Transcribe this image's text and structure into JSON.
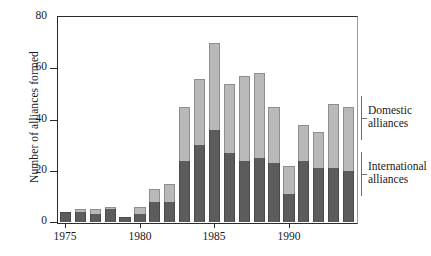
{
  "chart_data": {
    "type": "bar",
    "subtype": "stacked-vertical",
    "title": "",
    "xlabel": "",
    "ylabel": "Number of alliances formed",
    "ylim": [
      0,
      80
    ],
    "yticks": [
      0,
      20,
      40,
      60,
      80
    ],
    "xticks": [
      1975,
      1980,
      1985,
      1990
    ],
    "xtick_labels": [
      "1975",
      "1980",
      "1985",
      "1990"
    ],
    "grid": false,
    "legend_position": "right",
    "categories": [
      1975,
      1976,
      1977,
      1978,
      1979,
      1980,
      1981,
      1982,
      1983,
      1984,
      1985,
      1986,
      1987,
      1988,
      1989,
      1990,
      1991,
      1992,
      1993,
      1994
    ],
    "series": [
      {
        "name": "International alliances",
        "color": "#5c5c5c",
        "values": [
          4,
          4,
          3,
          5,
          2,
          3,
          8,
          8,
          24,
          30,
          36,
          27,
          24,
          25,
          23,
          11,
          24,
          21,
          21,
          20
        ]
      },
      {
        "name": "Domestic alliances",
        "color": "#b9b9b9",
        "values": [
          0,
          1,
          2,
          1,
          0,
          3,
          5,
          7,
          21,
          26,
          34,
          27,
          33,
          33,
          22,
          11,
          14,
          14,
          25,
          25
        ]
      }
    ],
    "totals": [
      4,
      5,
      5,
      6,
      2,
      6,
      13,
      15,
      45,
      56,
      70,
      54,
      57,
      58,
      45,
      22,
      38,
      35,
      46,
      45
    ]
  },
  "legend": {
    "entries": [
      {
        "label_line1": "Domestic",
        "label_line2": "alliances"
      },
      {
        "label_line1": "International",
        "label_line2": "alliances"
      }
    ]
  },
  "axis": {
    "y_title": "Number of alliances formed"
  }
}
